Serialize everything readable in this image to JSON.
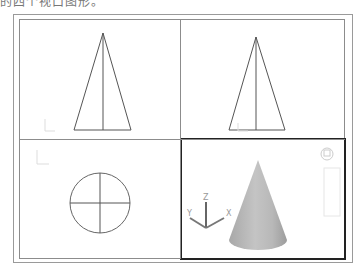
{
  "caption": "的四个视口图形。",
  "viewports": [
    {
      "name": "front-view",
      "label": "Front",
      "shape": "triangle",
      "active": false
    },
    {
      "name": "left-view",
      "label": "Left",
      "shape": "triangle",
      "active": false
    },
    {
      "name": "top-view",
      "label": "Top",
      "shape": "circle",
      "active": false
    },
    {
      "name": "southwest-isometric-view",
      "label": "SW Isometric",
      "shape": "cone",
      "active": true
    }
  ],
  "ucs_icon": {
    "x_label": "X",
    "y_label": "Y",
    "z_label": "Z"
  },
  "colors": {
    "line": "#555555",
    "active_border": "#222222",
    "frame": "#8c8c8c",
    "cone": "#b5b5b5"
  }
}
